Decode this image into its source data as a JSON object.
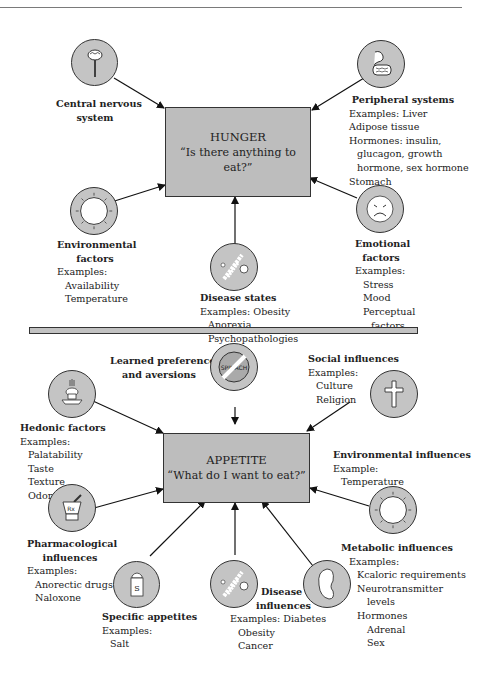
{
  "hunger": {
    "title": "HUNGER",
    "question": "“Is there anything to eat?”",
    "factors": {
      "central_nervous_system": {
        "title_line1": "Central nervous",
        "title_line2": "system",
        "icon": "brain-icon"
      },
      "peripheral_systems": {
        "title": "Peripheral systems",
        "lines": [
          "Examples: Liver",
          "Adipose tissue",
          "Hormones: insulin,",
          "glucagon, growth",
          "hormone, sex hormone",
          "Stomach"
        ],
        "icon": "digestive-system-icon"
      },
      "environmental_factors": {
        "title_line1": "Environmental",
        "title_line2": "factors",
        "examples_label": "Examples:",
        "examples": [
          "Availability",
          "Temperature"
        ],
        "icon": "thermometer-dial-icon"
      },
      "disease_states": {
        "title": "Disease states",
        "examples_label": "Examples: Obesity",
        "examples": [
          "Anorexia",
          "Psychopathologies"
        ],
        "icon": "microbe-icon"
      },
      "emotional_factors": {
        "title_line1": "Emotional",
        "title_line2": "factors",
        "examples_label": "Examples:",
        "examples": [
          "Stress",
          "Mood",
          "Perceptual",
          "factors"
        ],
        "icon": "sad-face-icon"
      }
    }
  },
  "appetite": {
    "title": "APPETITE",
    "question": "“What do I want to eat?”",
    "factors": {
      "learned_preferences": {
        "title_line1": "Learned preferences",
        "title_line2": "and aversions",
        "icon_text": "SPINACH",
        "icon": "no-spinach-icon"
      },
      "social_influences": {
        "title": "Social influences",
        "examples_label": "Examples:",
        "examples": [
          "Culture",
          "Religion"
        ],
        "icon": "cross-icon"
      },
      "hedonic_factors": {
        "title": "Hedonic factors",
        "examples_label": "Examples:",
        "examples": [
          "Palatability",
          "Taste",
          "Texture",
          "Odor"
        ],
        "icon": "food-dish-icon"
      },
      "environmental_influences": {
        "title": "Environmental influences",
        "examples_label": "Example:",
        "examples": [
          "Temperature"
        ],
        "icon": "thermometer-dial-icon"
      },
      "pharmacological_influences": {
        "title_line1": "Pharmacological",
        "title_line2": "influences",
        "examples_label": "Examples:",
        "examples": [
          "Anorectic drugs",
          "Naloxone"
        ],
        "icon": "mortar-pestle-icon",
        "icon_text": "Rx"
      },
      "metabolic_influences": {
        "title": "Metabolic influences",
        "examples_label": "Examples:",
        "examples": [
          "Kcaloric requirements",
          "Neurotransmitter",
          "levels",
          "Hormones",
          "Adrenal",
          "Sex"
        ],
        "icon": "kidney-icon"
      },
      "specific_appetites": {
        "title": "Specific appetites",
        "examples_label": "Examples:",
        "examples": [
          "Salt"
        ],
        "icon": "salt-shaker-icon",
        "icon_text": "S"
      },
      "disease_influences": {
        "title_line1": "Disease",
        "title_line2": "influences",
        "examples_label": "Examples: Diabetes",
        "examples": [
          "Obesity",
          "Cancer"
        ],
        "icon": "microbe-icon"
      }
    }
  },
  "colors": {
    "box_fill": "#bdbdbd",
    "circle_fill": "#c4c4c4",
    "stroke": "#333333"
  }
}
